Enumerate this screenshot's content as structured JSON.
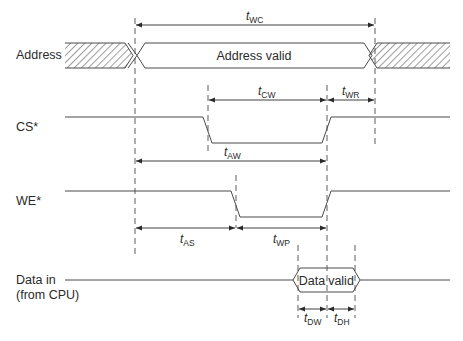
{
  "diagram": {
    "type": "timing-diagram",
    "colors": {
      "line": "#4a4a4a",
      "text": "#2a2a2a",
      "background": "#ffffff"
    },
    "signals": [
      {
        "id": "address",
        "label": "Address",
        "state_label": "Address valid"
      },
      {
        "id": "cs",
        "label": "CS*"
      },
      {
        "id": "we",
        "label": "WE*"
      },
      {
        "id": "data",
        "label_line1": "Data in",
        "label_line2": "(from CPU)",
        "state_label_1": "Data",
        "state_label_2": "valid"
      }
    ],
    "timings": {
      "twc": {
        "base": "t",
        "sub": "WC"
      },
      "tcw": {
        "base": "t",
        "sub": "CW"
      },
      "twr": {
        "base": "t",
        "sub": "WR"
      },
      "taw": {
        "base": "t",
        "sub": "AW"
      },
      "tas": {
        "base": "t",
        "sub": "AS"
      },
      "twp": {
        "base": "t",
        "sub": "WP"
      },
      "tdw": {
        "base": "t",
        "sub": "DW"
      },
      "tdh": {
        "base": "t",
        "sub": "DH"
      }
    }
  }
}
